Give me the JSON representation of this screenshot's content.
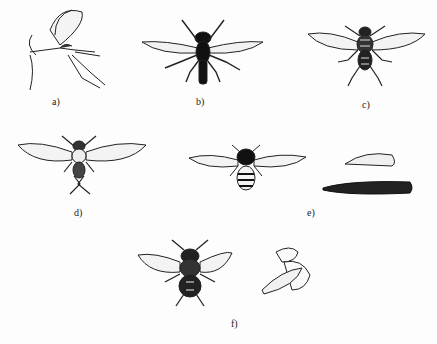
{
  "figure": {
    "panels": [
      {
        "id": "a",
        "label": "a)",
        "subject": "midge-side-view"
      },
      {
        "id": "b",
        "label": "b)",
        "subject": "dark-slender-fly-dorsal"
      },
      {
        "id": "c",
        "label": "c)",
        "subject": "fly-dorsal-striped-thorax"
      },
      {
        "id": "d",
        "label": "d)",
        "subject": "small-fly-dorsal"
      },
      {
        "id": "e",
        "label": "e)",
        "subject": "hoverfly-with-pupa-and-larva"
      },
      {
        "id": "f",
        "label": "f)",
        "subject": "housefly-dorsal-and-side-view"
      }
    ]
  }
}
